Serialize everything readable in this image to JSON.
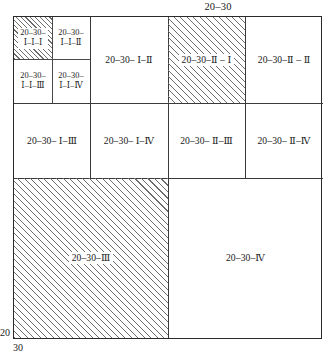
{
  "diagram": {
    "title": "20-30",
    "top_caption": "20–30",
    "axis": {
      "left_label": "20",
      "bottom_label": "30"
    },
    "hatch_color": "#6d6d6d",
    "line_color": "#2a2a2a",
    "background": "#ffffff",
    "cells": {
      "q1_1_1": "20–30–\nⅠ–Ⅰ–Ⅰ",
      "q1_1_1_line1": "20–30–",
      "q1_1_1_line2": "Ⅰ–Ⅰ–Ⅰ",
      "q1_1_2_line1": "20–30–",
      "q1_1_2_line2": "Ⅰ–Ⅰ–Ⅱ",
      "q1_1_3_line1": "20–30–",
      "q1_1_3_line2": "Ⅰ–Ⅰ–Ⅲ",
      "q1_1_4_line1": "20–30–",
      "q1_1_4_line2": "Ⅰ–Ⅰ–Ⅳ",
      "q1_2": "20–30– Ⅰ–Ⅱ",
      "q2_1": "20–30–Ⅱ – Ⅰ",
      "q2_2": "20–30–Ⅱ – Ⅱ",
      "q1_3": "20–30– Ⅰ–Ⅲ",
      "q1_4": "20–30– Ⅰ–Ⅳ",
      "q2_3": "20–30– Ⅱ–Ⅲ",
      "q2_4": "20–30– Ⅱ–Ⅳ",
      "q3": "20–30–Ⅲ",
      "q4": "20–30–Ⅳ"
    }
  }
}
